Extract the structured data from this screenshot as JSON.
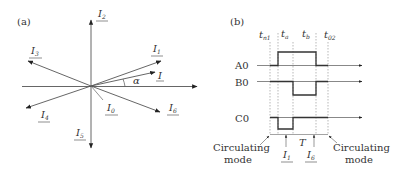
{
  "panel_a": {
    "label": "(a)",
    "vectors": [
      {
        "name": "I1",
        "main": "I",
        "sub": "1"
      },
      {
        "name": "I2",
        "main": "I",
        "sub": "2"
      },
      {
        "name": "I3",
        "main": "I",
        "sub": "3"
      },
      {
        "name": "I4",
        "main": "I",
        "sub": "4"
      },
      {
        "name": "I5",
        "main": "I",
        "sub": "5"
      },
      {
        "name": "I6",
        "main": "I",
        "sub": "6"
      },
      {
        "name": "I0",
        "main": "I",
        "sub": "0"
      },
      {
        "name": "I",
        "main": "I",
        "sub": ""
      }
    ],
    "angle_label": "α"
  },
  "panel_b": {
    "label": "(b)",
    "time_labels": [
      {
        "main": "t",
        "sub": "n1"
      },
      {
        "main": "t",
        "sub": "a"
      },
      {
        "main": "t",
        "sub": "b"
      },
      {
        "main": "t",
        "sub": "02"
      }
    ],
    "signals": [
      "A0",
      "B0",
      "C0"
    ],
    "period_label": "T",
    "bottom_vectors": [
      {
        "main": "I",
        "sub": "1"
      },
      {
        "main": "I",
        "sub": "6"
      }
    ],
    "mode_left": [
      "Circulating",
      "mode"
    ],
    "mode_right": [
      "Circulating",
      "mode"
    ]
  }
}
